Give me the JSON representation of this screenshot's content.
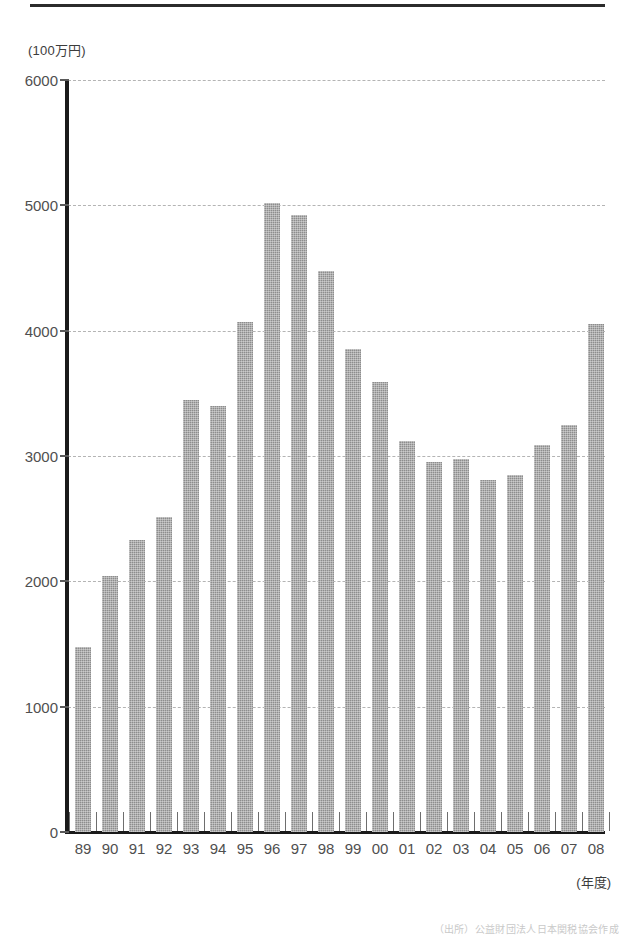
{
  "figure": {
    "unit_label": "(100万円)",
    "x_axis_title": "(年度)",
    "source_caption": "（出所）公益財団法人日本関税協会作成",
    "top_rule": "horizontal-rule"
  },
  "chart_data": {
    "type": "bar",
    "title": "",
    "subtitle": "",
    "xlabel": "(年度)",
    "ylabel": "(100万円)",
    "unit": "100万円",
    "categories": [
      "89",
      "90",
      "91",
      "92",
      "93",
      "94",
      "95",
      "96",
      "97",
      "98",
      "99",
      "00",
      "01",
      "02",
      "03",
      "04",
      "05",
      "06",
      "07",
      "08"
    ],
    "values": [
      1480,
      2040,
      2330,
      2510,
      3450,
      3400,
      4070,
      5020,
      4920,
      4480,
      3850,
      3590,
      3120,
      2950,
      2980,
      2810,
      2850,
      3090,
      3250,
      4050
    ],
    "series": [
      {
        "name": "金額",
        "values": [
          1480,
          2040,
          2330,
          2510,
          3450,
          3400,
          4070,
          5020,
          4920,
          4480,
          3850,
          3590,
          3120,
          2950,
          2980,
          2810,
          2850,
          3090,
          3250,
          4050
        ]
      }
    ],
    "ylim": [
      0,
      6000
    ],
    "ytick_values": [
      0,
      1000,
      2000,
      3000,
      4000,
      5000,
      6000
    ],
    "ytick_labels": [
      "0",
      "1000",
      "2000",
      "3000",
      "4000",
      "5000",
      "6000"
    ],
    "grid": true,
    "grid_style": "dashed",
    "legend": false,
    "legend_position": "none",
    "bar_color": "#8d8d8d",
    "axis_color": "#1a1a1a",
    "grid_color": "#b4b4b4"
  }
}
